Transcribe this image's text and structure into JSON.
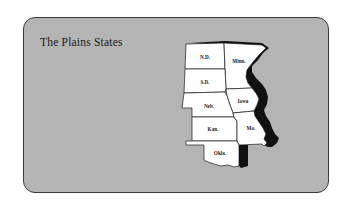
{
  "card": {
    "title": "The Plains States",
    "background_color": "#b4b4b4",
    "border_color": "#3a3a3a"
  },
  "map": {
    "fill_color": "#ffffff",
    "shadow_color": "#111111",
    "states": [
      {
        "abbr": "N.D.",
        "name": "North Dakota"
      },
      {
        "abbr": "Minn.",
        "name": "Minnesota"
      },
      {
        "abbr": "S.D.",
        "name": "South Dakota"
      },
      {
        "abbr": "Iowa",
        "name": "Iowa"
      },
      {
        "abbr": "Neb.",
        "name": "Nebraska"
      },
      {
        "abbr": "Kan.",
        "name": "Kansas"
      },
      {
        "abbr": "Mo.",
        "name": "Missouri"
      },
      {
        "abbr": "Okla.",
        "name": "Oklahoma"
      }
    ]
  }
}
